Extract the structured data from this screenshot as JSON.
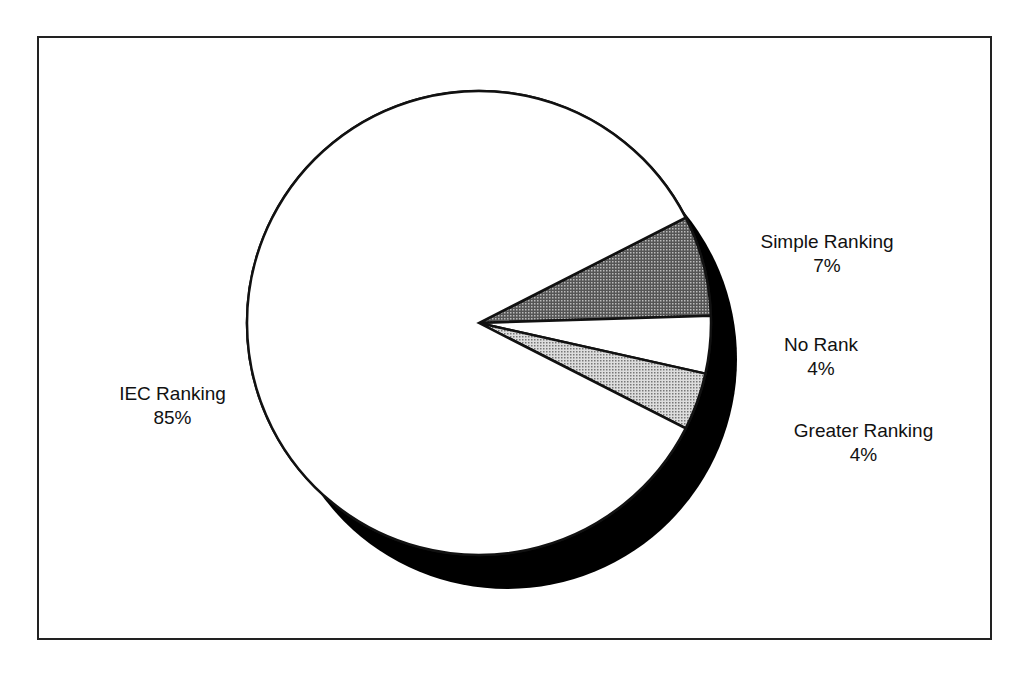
{
  "chart_data": {
    "type": "pie",
    "title": "",
    "style": "3d-shadow",
    "start_angle_deg": 27,
    "slices": [
      {
        "label": "Simple Ranking",
        "value": 7,
        "value_label": "7%",
        "fill": "dark-dots"
      },
      {
        "label": "No Rank",
        "value": 4,
        "value_label": "4%",
        "fill": "white"
      },
      {
        "label": "Greater Ranking",
        "value": 4,
        "value_label": "4%",
        "fill": "light-dots"
      },
      {
        "label": "IEC Ranking",
        "value": 85,
        "value_label": "85%",
        "fill": "white"
      }
    ],
    "legend": "none",
    "labels_position": "outside"
  },
  "labels": {
    "simple": {
      "name": "Simple Ranking",
      "pct": "7%"
    },
    "norank": {
      "name": "No Rank",
      "pct": "4%"
    },
    "greater": {
      "name": "Greater Ranking",
      "pct": "4%"
    },
    "iec": {
      "name": "IEC Ranking",
      "pct": "85%"
    }
  },
  "colors": {
    "outline": "#111111",
    "shadow": "#000000",
    "background": "#ffffff"
  }
}
